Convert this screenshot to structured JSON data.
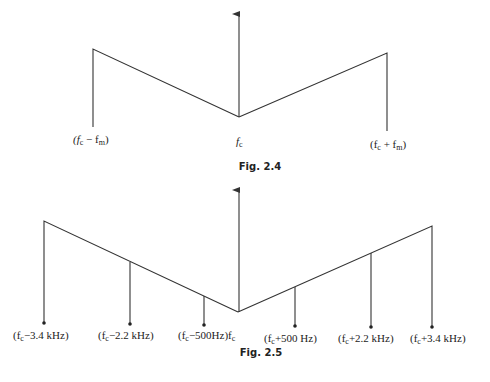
{
  "figures": [
    {
      "caption": "Fig. 2.4",
      "carrier_label": "f",
      "carrier_sub": "c",
      "labels": [
        {
          "text": "(f",
          "sub1": "c",
          "op": " − f",
          "sub2": "m",
          "close": ")"
        },
        {
          "text": "(f",
          "sub1": "c",
          "op": " + f",
          "sub2": "m",
          "close": ")"
        }
      ]
    },
    {
      "caption": "Fig. 2.5",
      "labels": [
        {
          "pre": "(f",
          "sub": "c",
          "post": "−3.4 kHz)"
        },
        {
          "pre": "(f",
          "sub": "c",
          "post": "−2.2 kHz)"
        },
        {
          "pre": "(f",
          "sub": "c",
          "post": "−500Hz)f"
        },
        {
          "pre": "(f",
          "sub": "c",
          "post": "+500 Hz)"
        },
        {
          "pre": "(f",
          "sub": "c",
          "post": "+2.2 kHz)"
        },
        {
          "pre": "(f",
          "sub": "c",
          "post": "+3.4 kHz)"
        }
      ],
      "carrier_sub": "c"
    }
  ],
  "colors": {
    "line": "#333333",
    "text": "#222222"
  }
}
